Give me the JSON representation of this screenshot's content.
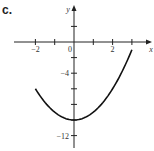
{
  "part_label": "c.",
  "chart_data": {
    "type": "line",
    "title": "",
    "xlabel": "x",
    "ylabel": "y",
    "x_ticks": [
      -2,
      -1,
      0,
      1,
      2,
      3
    ],
    "x_tick_labels": [
      "-2",
      "0",
      "2"
    ],
    "y_ticks": [
      2,
      0,
      -2,
      -4,
      -6,
      -8,
      -10,
      -12
    ],
    "y_tick_labels": [
      "-4",
      "-12"
    ],
    "xlim": [
      -3.5,
      4
    ],
    "ylim": [
      -13,
      4.5
    ],
    "grid": false,
    "series": [
      {
        "name": "f(x)",
        "function": "x^2 - 10",
        "x": [
          -2,
          -1.5,
          -1,
          -0.5,
          0,
          0.5,
          1,
          1.5,
          2,
          2.5,
          3
        ],
        "y": [
          -6,
          -7.75,
          -9,
          -9.75,
          -10,
          -9.75,
          -9,
          -7.75,
          -6,
          -3.75,
          -1
        ]
      }
    ]
  }
}
